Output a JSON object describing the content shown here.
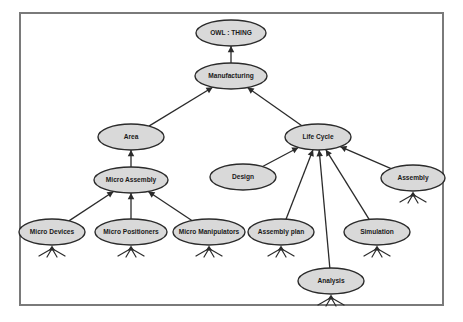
{
  "figure": {
    "frame": {
      "x": 20,
      "y": 13,
      "width": 423,
      "height": 292,
      "stroke": "#7a7a7a"
    },
    "style": {
      "node_fill": "#d9d9d9",
      "node_stroke": "#2b2b2b",
      "edge_stroke": "#2b2b2b",
      "label_color": "#1a1a1a",
      "background": "#ffffff",
      "leaf_mark_stroke": "#2b2b2b"
    }
  },
  "chart_data": {
    "type": "diagram",
    "diagram_kind": "ontology-class-hierarchy",
    "nodes": [
      {
        "id": "owl-thing",
        "label": "OWL : THING",
        "cx": 231,
        "cy": 33,
        "rx": 35,
        "ry": 13,
        "font_size": 6.6,
        "leaf": false
      },
      {
        "id": "manufacturing",
        "label": "Manufacturing",
        "cx": 231,
        "cy": 76,
        "rx": 36,
        "ry": 13,
        "font_size": 6.6,
        "leaf": false
      },
      {
        "id": "area",
        "label": "Area",
        "cx": 131,
        "cy": 137,
        "rx": 33,
        "ry": 13,
        "font_size": 6.6,
        "leaf": false
      },
      {
        "id": "life-cycle",
        "label": "Life Cycle",
        "cx": 318,
        "cy": 137,
        "rx": 33,
        "ry": 13,
        "font_size": 6.6,
        "leaf": false
      },
      {
        "id": "micro-assembly",
        "label": "Micro Assembly",
        "cx": 131,
        "cy": 180,
        "rx": 37,
        "ry": 13,
        "font_size": 6.6,
        "leaf": false
      },
      {
        "id": "design",
        "label": "Design",
        "cx": 243,
        "cy": 177,
        "rx": 33,
        "ry": 13,
        "font_size": 6.6,
        "leaf": false
      },
      {
        "id": "assembly",
        "label": "Assembly",
        "cx": 413,
        "cy": 178,
        "rx": 32,
        "ry": 13,
        "font_size": 6.6,
        "leaf": true
      },
      {
        "id": "micro-devices",
        "label": "Micro Devices",
        "cx": 52,
        "cy": 232,
        "rx": 33,
        "ry": 13,
        "font_size": 6.6,
        "leaf": true
      },
      {
        "id": "micro-positioners",
        "label": "Micro Positioners",
        "cx": 131,
        "cy": 232,
        "rx": 36,
        "ry": 13,
        "font_size": 6.6,
        "leaf": true
      },
      {
        "id": "micro-manipulators",
        "label": "Micro Manipulators",
        "cx": 209,
        "cy": 232,
        "rx": 36,
        "ry": 13,
        "font_size": 6.6,
        "leaf": true
      },
      {
        "id": "assembly-plan",
        "label": "Assembly plan",
        "cx": 281,
        "cy": 232,
        "rx": 33,
        "ry": 13,
        "font_size": 6.6,
        "leaf": true
      },
      {
        "id": "simulation",
        "label": "Simulation",
        "cx": 377,
        "cy": 232,
        "rx": 33,
        "ry": 13,
        "font_size": 6.6,
        "leaf": true
      },
      {
        "id": "analysis",
        "label": "Analysis",
        "cx": 331,
        "cy": 281,
        "rx": 33,
        "ry": 13,
        "font_size": 6.6,
        "leaf": true
      }
    ],
    "edges": [
      {
        "from": "manufacturing",
        "to": "owl-thing",
        "relation": "is-a"
      },
      {
        "from": "area",
        "to": "manufacturing",
        "relation": "is-a"
      },
      {
        "from": "life-cycle",
        "to": "manufacturing",
        "relation": "is-a"
      },
      {
        "from": "micro-assembly",
        "to": "area",
        "relation": "is-a"
      },
      {
        "from": "design",
        "to": "life-cycle",
        "relation": "is-a"
      },
      {
        "from": "assembly",
        "to": "life-cycle",
        "relation": "is-a"
      },
      {
        "from": "micro-devices",
        "to": "micro-assembly",
        "relation": "is-a"
      },
      {
        "from": "micro-positioners",
        "to": "micro-assembly",
        "relation": "is-a"
      },
      {
        "from": "micro-manipulators",
        "to": "micro-assembly",
        "relation": "is-a"
      },
      {
        "from": "assembly-plan",
        "to": "life-cycle",
        "relation": "is-a"
      },
      {
        "from": "simulation",
        "to": "life-cycle",
        "relation": "is-a"
      },
      {
        "from": "analysis",
        "to": "life-cycle",
        "relation": "is-a"
      }
    ],
    "legend": []
  }
}
